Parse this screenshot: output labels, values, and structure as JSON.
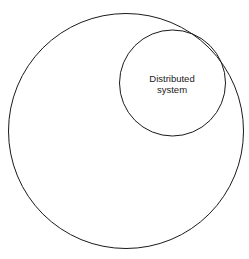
{
  "diagram": {
    "outer_circle": {
      "cx": 126,
      "cy": 131,
      "r": 117.5,
      "stroke": "#1a1a1a"
    },
    "inner_circle": {
      "cx": 172.5,
      "cy": 83,
      "r": 53,
      "stroke": "#1a1a1a"
    },
    "label": {
      "line1": "Distributed",
      "line2": "system"
    }
  }
}
